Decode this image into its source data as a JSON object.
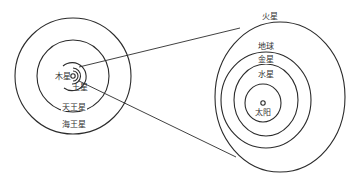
{
  "diagram": {
    "type": "solar-system-orbits",
    "colors": {
      "stroke": "#2b2b2b",
      "label": "#333333",
      "background": "#ffffff"
    },
    "outer_system": {
      "labels": {
        "jupiter": "木星",
        "saturn": "土星",
        "uranus": "天王星",
        "neptune": "海王星"
      }
    },
    "inner_system": {
      "labels": {
        "mars": "火星",
        "earth": "地球",
        "venus": "金星",
        "mercury": "水星",
        "sun": "太阳"
      }
    }
  }
}
